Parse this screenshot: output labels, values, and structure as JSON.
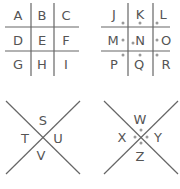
{
  "colors": {
    "line": "#666666",
    "text": "#555555",
    "dot": "#999999"
  },
  "grid1": {
    "letters": [
      "A",
      "B",
      "C",
      "D",
      "E",
      "F",
      "G",
      "H",
      "I"
    ],
    "dotted": false
  },
  "grid2": {
    "letters": [
      "J",
      "K",
      "L",
      "M",
      "N",
      "O",
      "P",
      "Q",
      "R"
    ],
    "dotted": true
  },
  "x1": {
    "letters": {
      "top": "S",
      "left": "T",
      "right": "U",
      "bottom": "V"
    },
    "dotted": false
  },
  "x2": {
    "letters": {
      "top": "W",
      "left": "X",
      "right": "Y",
      "bottom": "Z"
    },
    "dotted": true
  }
}
